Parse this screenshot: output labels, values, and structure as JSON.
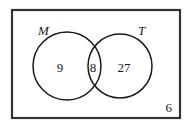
{
  "diagram": {
    "type": "venn-two-set",
    "universe": {
      "shape": "rectangle",
      "outside_value": "6",
      "border_color": "#333333",
      "background_color": "#ffffff"
    },
    "sets": [
      {
        "id": "left",
        "label": "M",
        "only_value": "9",
        "stroke_color": "#1a1a1a"
      },
      {
        "id": "right",
        "label": "T",
        "only_value": "27",
        "stroke_color": "#1a1a1a"
      }
    ],
    "intersection": {
      "label": "M and T",
      "value": "8"
    }
  }
}
